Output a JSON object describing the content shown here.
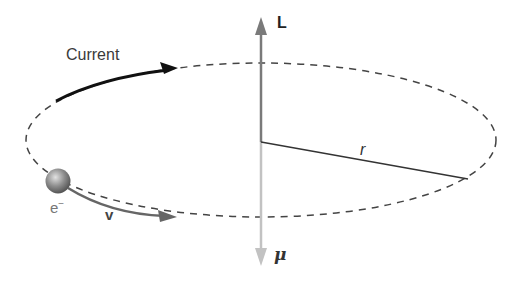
{
  "diagram": {
    "labels": {
      "current": "Current",
      "angular_momentum": "L",
      "magnetic_moment": "μ",
      "radius": "r",
      "electron": "e",
      "electron_charge": "−",
      "velocity": "v"
    },
    "colors": {
      "orbit": "#444444",
      "current_arrow": "#111111",
      "velocity_arrow": "#666666",
      "L_vector": "#777777",
      "mu_vector": "#bbbbbb",
      "radius_line": "#333333",
      "electron": "#8a8a8a"
    }
  }
}
